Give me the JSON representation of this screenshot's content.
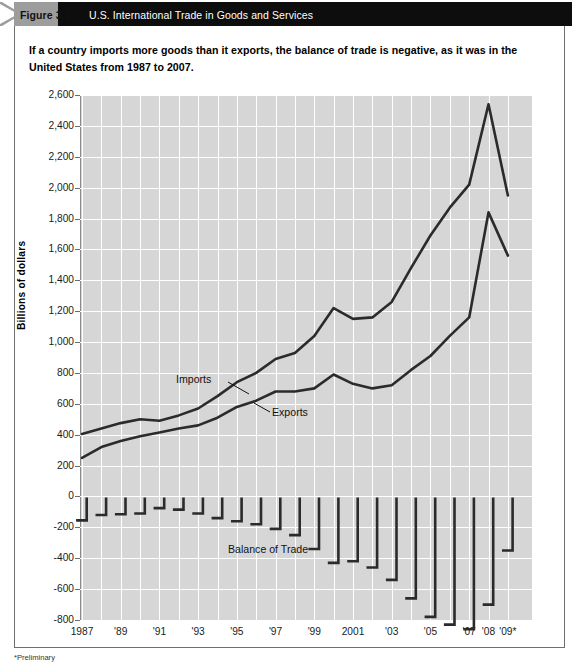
{
  "header": {
    "figure_label": "Figure 3.2",
    "title": "U.S. International Trade in Goods and Services",
    "band_color": "#0d0d0d",
    "tab_color": "#9d9d9d"
  },
  "caption": "If a country imports more goods than it exports, the balance of trade is negative, as it was in the United States from 1987 to 2007.",
  "footnote": "*Preliminary",
  "annotations": {
    "imports": "Imports",
    "exports": "Exports",
    "balance": "Balance of Trade"
  },
  "chart_data": {
    "type": "line",
    "title": "U.S. International Trade in Goods and Services",
    "xlabel": "",
    "ylabel": "Billions of dollars",
    "ylim": [
      -800,
      2600
    ],
    "ytick_step": 200,
    "grid": true,
    "legend": "inline-annotations",
    "plot_background": "#d6d6d6",
    "gridline_color": "#ffffff",
    "line_color": "#2b2b2b",
    "x": [
      1987,
      1988,
      1989,
      1990,
      1991,
      1992,
      1993,
      1994,
      1995,
      1996,
      1997,
      1998,
      1999,
      2000,
      2001,
      2002,
      2003,
      2004,
      2005,
      2006,
      2007,
      2008,
      2009
    ],
    "xtick_labels": [
      "1987",
      "",
      "'89",
      "",
      "'91",
      "",
      "'93",
      "",
      "'95",
      "",
      "'97",
      "",
      "'99",
      "",
      "2001",
      "",
      "'03",
      "",
      "'05",
      "",
      "'07",
      "'08",
      "'09*"
    ],
    "ytick_labels": [
      "2,600",
      "2,400",
      "2,200",
      "2,000",
      "1,800",
      "1,600",
      "1,400",
      "1,200",
      "1,000",
      "800",
      "600",
      "400",
      "200",
      "0",
      "-200",
      "-400",
      "-600",
      "-800"
    ],
    "series": [
      {
        "name": "Imports",
        "values": [
          405,
          440,
          475,
          500,
          490,
          525,
          570,
          650,
          740,
          800,
          890,
          930,
          1040,
          1220,
          1150,
          1160,
          1260,
          1480,
          1690,
          1870,
          2020,
          2540,
          1950
        ]
      },
      {
        "name": "Exports",
        "values": [
          250,
          320,
          360,
          390,
          415,
          440,
          460,
          510,
          580,
          620,
          680,
          680,
          700,
          790,
          730,
          700,
          720,
          820,
          910,
          1040,
          1160,
          1840,
          1560
        ]
      },
      {
        "name": "Balance of Trade",
        "values": [
          -155,
          -120,
          -115,
          -110,
          -75,
          -85,
          -110,
          -140,
          -160,
          -180,
          -210,
          -250,
          -340,
          -430,
          -420,
          -460,
          -540,
          -660,
          -780,
          -830,
          -860,
          -700,
          -350
        ]
      }
    ]
  }
}
